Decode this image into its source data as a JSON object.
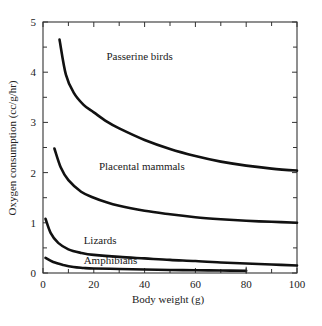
{
  "chart_data": {
    "type": "line",
    "title": "",
    "xlabel": "Body weight (g)",
    "ylabel": "Oxygen consumption (cc/g/hr)",
    "xlim": [
      0,
      100
    ],
    "ylim": [
      0,
      5
    ],
    "x_ticks": [
      0,
      20,
      40,
      60,
      80,
      100
    ],
    "x_minor_ticks": [
      10,
      30,
      50,
      70,
      90
    ],
    "y_ticks": [
      0,
      1,
      2,
      3,
      4,
      5
    ],
    "y_minor_ticks": [
      0.5,
      1.5,
      2.5,
      3.5,
      4.5
    ],
    "grid": false,
    "legend": "inline labels",
    "series": [
      {
        "name": "Passerine birds",
        "label_pos": [
          25,
          4.25
        ],
        "x": [
          6.5,
          9,
          12,
          16,
          20,
          25,
          30,
          40,
          50,
          60,
          70,
          80,
          90,
          100
        ],
        "y": [
          4.65,
          3.95,
          3.6,
          3.35,
          3.2,
          3.02,
          2.88,
          2.65,
          2.47,
          2.33,
          2.22,
          2.14,
          2.08,
          2.04
        ]
      },
      {
        "name": "Placental mammals",
        "label_pos": [
          22,
          2.05
        ],
        "x": [
          4.5,
          7,
          10,
          15,
          20,
          25,
          30,
          40,
          50,
          60,
          70,
          80,
          90,
          100
        ],
        "y": [
          2.48,
          2.1,
          1.85,
          1.62,
          1.5,
          1.41,
          1.34,
          1.24,
          1.17,
          1.11,
          1.07,
          1.04,
          1.02,
          1.0
        ]
      },
      {
        "name": "Lizards",
        "label_pos": [
          16,
          0.57
        ],
        "x": [
          1,
          3,
          6,
          10,
          15,
          20,
          30,
          40,
          50,
          60,
          70,
          80,
          90,
          100
        ],
        "y": [
          1.08,
          0.8,
          0.6,
          0.47,
          0.4,
          0.36,
          0.32,
          0.29,
          0.26,
          0.24,
          0.21,
          0.19,
          0.17,
          0.15
        ]
      },
      {
        "name": "Amphibians",
        "label_pos": [
          16,
          0.17
        ],
        "x": [
          1,
          4,
          8,
          12,
          16,
          20,
          30,
          40,
          50,
          60,
          70,
          80
        ],
        "y": [
          0.3,
          0.22,
          0.16,
          0.12,
          0.1,
          0.09,
          0.08,
          0.07,
          0.06,
          0.055,
          0.05,
          0.045
        ]
      }
    ]
  }
}
